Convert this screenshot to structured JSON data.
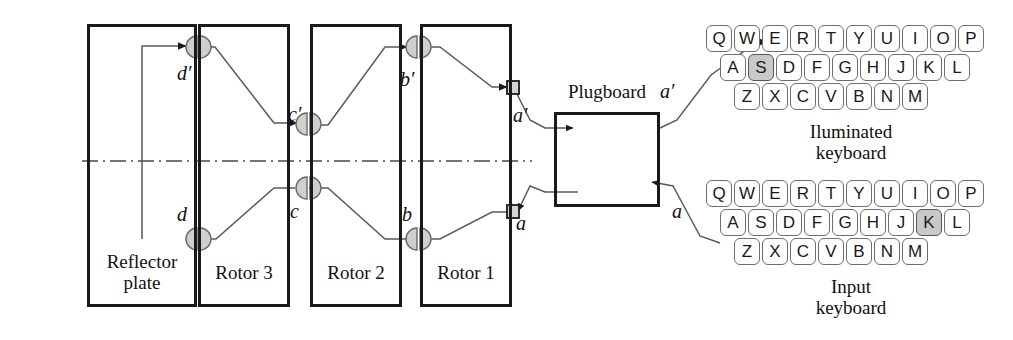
{
  "diagram": {
    "title_note": "Enigma machine signal path diagram",
    "components": [
      {
        "name": "reflector-plate",
        "label": "Reflector\nplate",
        "x": 87,
        "y": 24,
        "w": 110,
        "h": 283
      },
      {
        "name": "rotor-3",
        "label": "Rotor 3",
        "x": 198,
        "y": 24,
        "w": 92,
        "h": 283
      },
      {
        "name": "rotor-2",
        "label": "Rotor 2",
        "x": 310,
        "y": 24,
        "w": 92,
        "h": 283
      },
      {
        "name": "rotor-1",
        "label": "Rotor 1",
        "x": 420,
        "y": 24,
        "w": 92,
        "h": 283
      },
      {
        "name": "plugboard",
        "label": "Plugboard",
        "x": 554,
        "y": 112,
        "w": 106,
        "h": 95
      }
    ],
    "plugboard_title": "Plugboard",
    "wire_labels": [
      {
        "name": "label-d-prime",
        "text": "d′",
        "x": 177,
        "y": 62
      },
      {
        "name": "label-c-prime",
        "text": "c′",
        "x": 288,
        "y": 103
      },
      {
        "name": "label-b-prime",
        "text": "b′",
        "x": 400,
        "y": 68
      },
      {
        "name": "label-a-prime-rotor",
        "text": "a′",
        "x": 513,
        "y": 104
      },
      {
        "name": "label-d",
        "text": "d",
        "x": 177,
        "y": 203
      },
      {
        "name": "label-c",
        "text": "c",
        "x": 290,
        "y": 200
      },
      {
        "name": "label-b",
        "text": "b",
        "x": 402,
        "y": 203
      },
      {
        "name": "label-a-rotor",
        "text": "a",
        "x": 516,
        "y": 212
      },
      {
        "name": "label-a-prime-plugboard",
        "text": "a′",
        "x": 660,
        "y": 80
      },
      {
        "name": "label-a-plugboard",
        "text": "a",
        "x": 672,
        "y": 200
      }
    ],
    "centerline": {
      "name": "axis-centerline",
      "y": 161,
      "x1": 82,
      "x2": 532
    }
  },
  "keyboards": [
    {
      "name": "illuminated-keyboard",
      "caption": "Iluminated\nkeyboard",
      "x": 706,
      "y": 25,
      "highlight": "S",
      "rows": [
        [
          "Q",
          "W",
          "E",
          "R",
          "T",
          "Y",
          "U",
          "I",
          "O",
          "P"
        ],
        [
          "A",
          "S",
          "D",
          "F",
          "G",
          "H",
          "J",
          "K",
          "L"
        ],
        [
          "Z",
          "X",
          "C",
          "V",
          "B",
          "N",
          "M"
        ]
      ]
    },
    {
      "name": "input-keyboard",
      "caption": "Input\nkeyboard",
      "x": 706,
      "y": 180,
      "highlight": "K",
      "rows": [
        [
          "Q",
          "W",
          "E",
          "R",
          "T",
          "Y",
          "U",
          "I",
          "O",
          "P"
        ],
        [
          "A",
          "S",
          "D",
          "F",
          "G",
          "H",
          "J",
          "K",
          "L"
        ],
        [
          "Z",
          "X",
          "C",
          "V",
          "B",
          "N",
          "M"
        ]
      ]
    }
  ],
  "colors": {
    "ink": "#1a1a1a",
    "wire": "#555555",
    "contact_fill": "#cccccc",
    "key_highlight": "#c9c9c9",
    "background": "#ffffff"
  }
}
